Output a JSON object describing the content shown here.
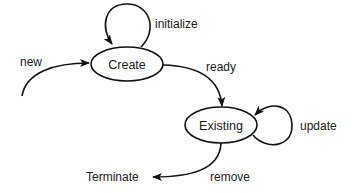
{
  "diagram": {
    "type": "state-diagram",
    "states": [
      {
        "id": "create",
        "label": "Create"
      },
      {
        "id": "existing",
        "label": "Existing"
      }
    ],
    "terminal": {
      "label": "Terminate"
    },
    "transitions": [
      {
        "id": "new",
        "label": "new",
        "from": null,
        "to": "create"
      },
      {
        "id": "initialize",
        "label": "initialize",
        "from": "create",
        "to": "create"
      },
      {
        "id": "ready",
        "label": "ready",
        "from": "create",
        "to": "existing"
      },
      {
        "id": "update",
        "label": "update",
        "from": "existing",
        "to": "existing"
      },
      {
        "id": "remove",
        "label": "remove",
        "from": "existing",
        "to": "terminate"
      }
    ],
    "colors": {
      "stroke": "#111111",
      "background": "#ffffff",
      "text": "#1a1a1a"
    }
  }
}
